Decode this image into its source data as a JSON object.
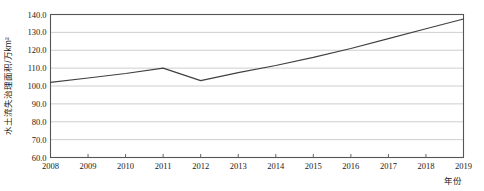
{
  "chart_data": {
    "type": "line",
    "title": "",
    "xlabel": "年份",
    "ylabel": "水土流失治理面积/万km²",
    "x": [
      2008,
      2009,
      2010,
      2011,
      2012,
      2013,
      2014,
      2015,
      2016,
      2017,
      2018,
      2019
    ],
    "xticklabels": [
      "2008",
      "2009",
      "2010",
      "2011",
      "2012",
      "2013",
      "2014",
      "2015",
      "2016",
      "2017",
      "2018",
      "2019"
    ],
    "values": [
      102.0,
      104.5,
      107.0,
      110.0,
      103.0,
      107.5,
      111.5,
      116.0,
      121.0,
      126.5,
      132.0,
      137.5
    ],
    "yticks": [
      60.0,
      70.0,
      80.0,
      90.0,
      100.0,
      110.0,
      120.0,
      130.0,
      140.0
    ],
    "yticklabels": [
      "60.0",
      "70.0",
      "80.0",
      "90.0",
      "100.0",
      "110.0",
      "120.0",
      "130.0",
      "140.0"
    ],
    "ylim": [
      60.0,
      140.0
    ],
    "xlim": [
      2008,
      2019
    ],
    "grid": "horizontal",
    "legend": "none",
    "series": [
      {
        "name": "水土流失治理面积",
        "values": [
          102.0,
          104.5,
          107.0,
          110.0,
          103.0,
          107.5,
          111.5,
          116.0,
          121.0,
          126.5,
          132.0,
          137.5
        ]
      }
    ],
    "colors": {
      "line": "#404040",
      "grid": "#c8c8c8",
      "frame": "#555555",
      "text": "#1a1a1a",
      "background": "#ffffff"
    }
  }
}
